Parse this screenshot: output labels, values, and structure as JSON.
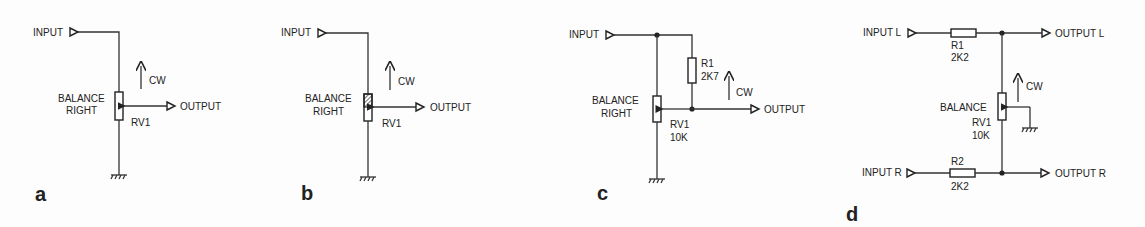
{
  "figure": {
    "colors": {
      "ink": "#222222",
      "background": "#fdfdfd"
    }
  },
  "panels": [
    {
      "id": "a",
      "label": "a",
      "input": "INPUT",
      "output": "OUTPUT",
      "pot_label_line1": "BALANCE",
      "pot_label_line2": "RIGHT",
      "pot_ref": "RV1",
      "direction": "CW"
    },
    {
      "id": "b",
      "label": "b",
      "input": "INPUT",
      "output": "OUTPUT",
      "pot_label_line1": "BALANCE",
      "pot_label_line2": "RIGHT",
      "pot_ref": "RV1",
      "direction": "CW"
    },
    {
      "id": "c",
      "label": "c",
      "input": "INPUT",
      "output": "OUTPUT",
      "pot_label_line1": "BALANCE",
      "pot_label_line2": "RIGHT",
      "pot_ref": "RV1",
      "pot_value": "10K",
      "resistor_ref": "R1",
      "resistor_value": "2K7",
      "direction": "CW"
    },
    {
      "id": "d",
      "label": "d",
      "input_l": "INPUT L",
      "input_r": "INPUT R",
      "output_l": "OUTPUT L",
      "output_r": "OUTPUT R",
      "pot_label": "BALANCE",
      "pot_ref": "RV1",
      "pot_value": "10K",
      "r1_ref": "R1",
      "r1_value": "2K2",
      "r2_ref": "R2",
      "r2_value": "2K2",
      "direction": "CW"
    }
  ]
}
